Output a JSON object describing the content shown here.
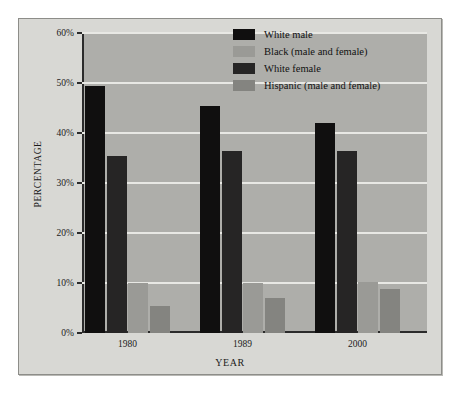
{
  "chart_data": {
    "type": "bar",
    "title": "",
    "xlabel": "YEAR",
    "ylabel": "PERCENTAGE",
    "categories": [
      "1980",
      "1989",
      "2000"
    ],
    "ylim": [
      0,
      60
    ],
    "yticks": [
      0,
      10,
      20,
      30,
      40,
      50,
      60
    ],
    "ytick_labels": [
      "0%",
      "10%",
      "20%",
      "30%",
      "40%",
      "50%",
      "60%"
    ],
    "grid": true,
    "legend_position": "top-right",
    "value_unit": "%",
    "series": [
      {
        "name": "White male",
        "color": "#100f0f",
        "values": [
          49.5,
          45.5,
          42.0
        ],
        "draw_order": 0
      },
      {
        "name": "Black (male and female)",
        "color": "#9a9a96",
        "values": [
          10.0,
          10.0,
          10.3
        ],
        "draw_order": 2
      },
      {
        "name": "White female",
        "color": "#262525",
        "values": [
          35.5,
          36.5,
          36.5
        ],
        "draw_order": 1
      },
      {
        "name": "Hispanic (male and female)",
        "color": "#848480",
        "values": [
          5.5,
          7.0,
          8.8
        ],
        "draw_order": 3
      }
    ]
  },
  "figure": {
    "background": "#d8d8d4",
    "plot_background": "#aeaeaa",
    "gridline_color": "#e8e8e4",
    "axis_color": "#2b2b2b"
  }
}
